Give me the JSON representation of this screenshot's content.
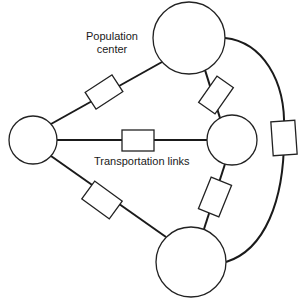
{
  "diagram": {
    "type": "network",
    "labels": {
      "population_center": [
        "Population",
        "center"
      ],
      "transportation_links": "Transportation links"
    },
    "nodes": [
      {
        "id": "top",
        "cx": 189,
        "cy": 38,
        "r": 36
      },
      {
        "id": "left",
        "cx": 33,
        "cy": 140,
        "r": 24
      },
      {
        "id": "right",
        "cx": 232,
        "cy": 140,
        "r": 25
      },
      {
        "id": "bottom",
        "cx": 191,
        "cy": 262,
        "r": 35
      }
    ],
    "links": [
      {
        "from": "left",
        "to": "top"
      },
      {
        "from": "top",
        "to": "right"
      },
      {
        "from": "left",
        "to": "right"
      },
      {
        "from": "left",
        "to": "bottom"
      },
      {
        "from": "right",
        "to": "bottom"
      },
      {
        "from": "top",
        "to": "bottom",
        "shape": "arc"
      }
    ],
    "colors": {
      "stroke": "#1a1a1a",
      "fill": "#ffffff",
      "background": "#ffffff"
    }
  }
}
